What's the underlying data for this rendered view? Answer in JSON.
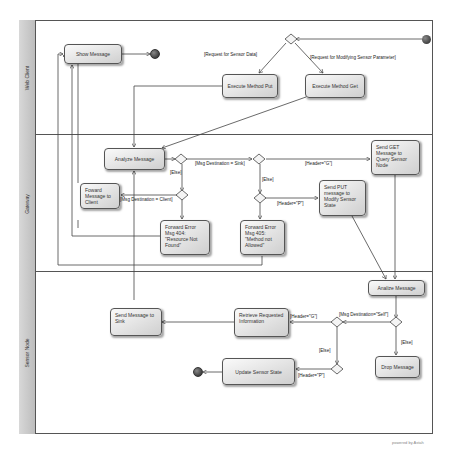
{
  "diagram": {
    "type": "uml-activity-diagram-with-swimlanes",
    "lanes": [
      {
        "id": "web",
        "label": "Web Client"
      },
      {
        "id": "gw",
        "label": "Gateway"
      },
      {
        "id": "sn",
        "label": "Sensor Node"
      }
    ],
    "activities": {
      "show_message": "Show Message",
      "execute_put": "Execute Method Put",
      "execute_get": "Execute Method Get",
      "analyze_message_gw": "Analyze Message",
      "forward_to_client": "Foward Message to Client",
      "forward_error_404": "Forward Error Msg 404: \"Resource Not Found\"",
      "forward_error_405": "Forward Error Msg 405: \"Method not Allowed\"",
      "send_put": "Send PUT message to Modify Sensor State",
      "send_get": "Send GET Message to Query Sensor Node",
      "analize_message_sn": "Analize Message",
      "send_to_sink": "Send Message to Sink",
      "retrieve_info": "Retrieve Requested Information",
      "update_sensor": "Update Sensor State",
      "drop_message": "Drop Message"
    },
    "guards": {
      "req_sensor_data": "[Request for Sensor Data]",
      "req_modify_param": "[Request for Modifying Sensor Parameter]",
      "msg_dest_sink": "[Msg Destination = Sink]",
      "else_1": "[Else]",
      "msg_dest_client": "[Msg Destination = Client]",
      "header_g_gw": "[Header=\"G\"]",
      "else_2": "[Else]",
      "header_p_gw": "[Header=\"P\"]",
      "msg_dest_self": "[Msg Destination=\"Self\"]",
      "else_3": "[Else]",
      "header_g_sn": "[Header=\"G\"]",
      "else_4": "[Else]",
      "header_p_sn": "[Header=\"P\"]"
    },
    "watermark": "powered by Astah"
  }
}
